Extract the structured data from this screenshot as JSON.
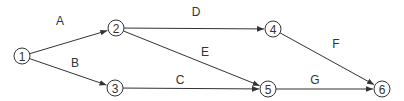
{
  "diagram": {
    "type": "activity-on-arrow network",
    "colors": {
      "stroke": "#333333",
      "text": "#333333",
      "background": "#ffffff"
    },
    "nodes": [
      {
        "id": "1",
        "label": "1",
        "x": 22,
        "y": 56
      },
      {
        "id": "2",
        "label": "2",
        "x": 116,
        "y": 28
      },
      {
        "id": "3",
        "label": "3",
        "x": 115,
        "y": 88
      },
      {
        "id": "4",
        "label": "4",
        "x": 273,
        "y": 29
      },
      {
        "id": "5",
        "label": "5",
        "x": 268,
        "y": 89
      },
      {
        "id": "6",
        "label": "6",
        "x": 382,
        "y": 89
      }
    ],
    "edges": [
      {
        "label": "A",
        "from": "1",
        "to": "2",
        "lx": 60,
        "ly": 25
      },
      {
        "label": "B",
        "from": "1",
        "to": "3",
        "lx": 75,
        "ly": 67
      },
      {
        "label": "C",
        "from": "3",
        "to": "5",
        "lx": 180,
        "ly": 84
      },
      {
        "label": "D",
        "from": "2",
        "to": "4",
        "lx": 196,
        "ly": 16
      },
      {
        "label": "E",
        "from": "2",
        "to": "5",
        "lx": 205,
        "ly": 56
      },
      {
        "label": "F",
        "from": "4",
        "to": "6",
        "lx": 336,
        "ly": 48
      },
      {
        "label": "G",
        "from": "5",
        "to": "6",
        "lx": 315,
        "ly": 84
      }
    ]
  }
}
